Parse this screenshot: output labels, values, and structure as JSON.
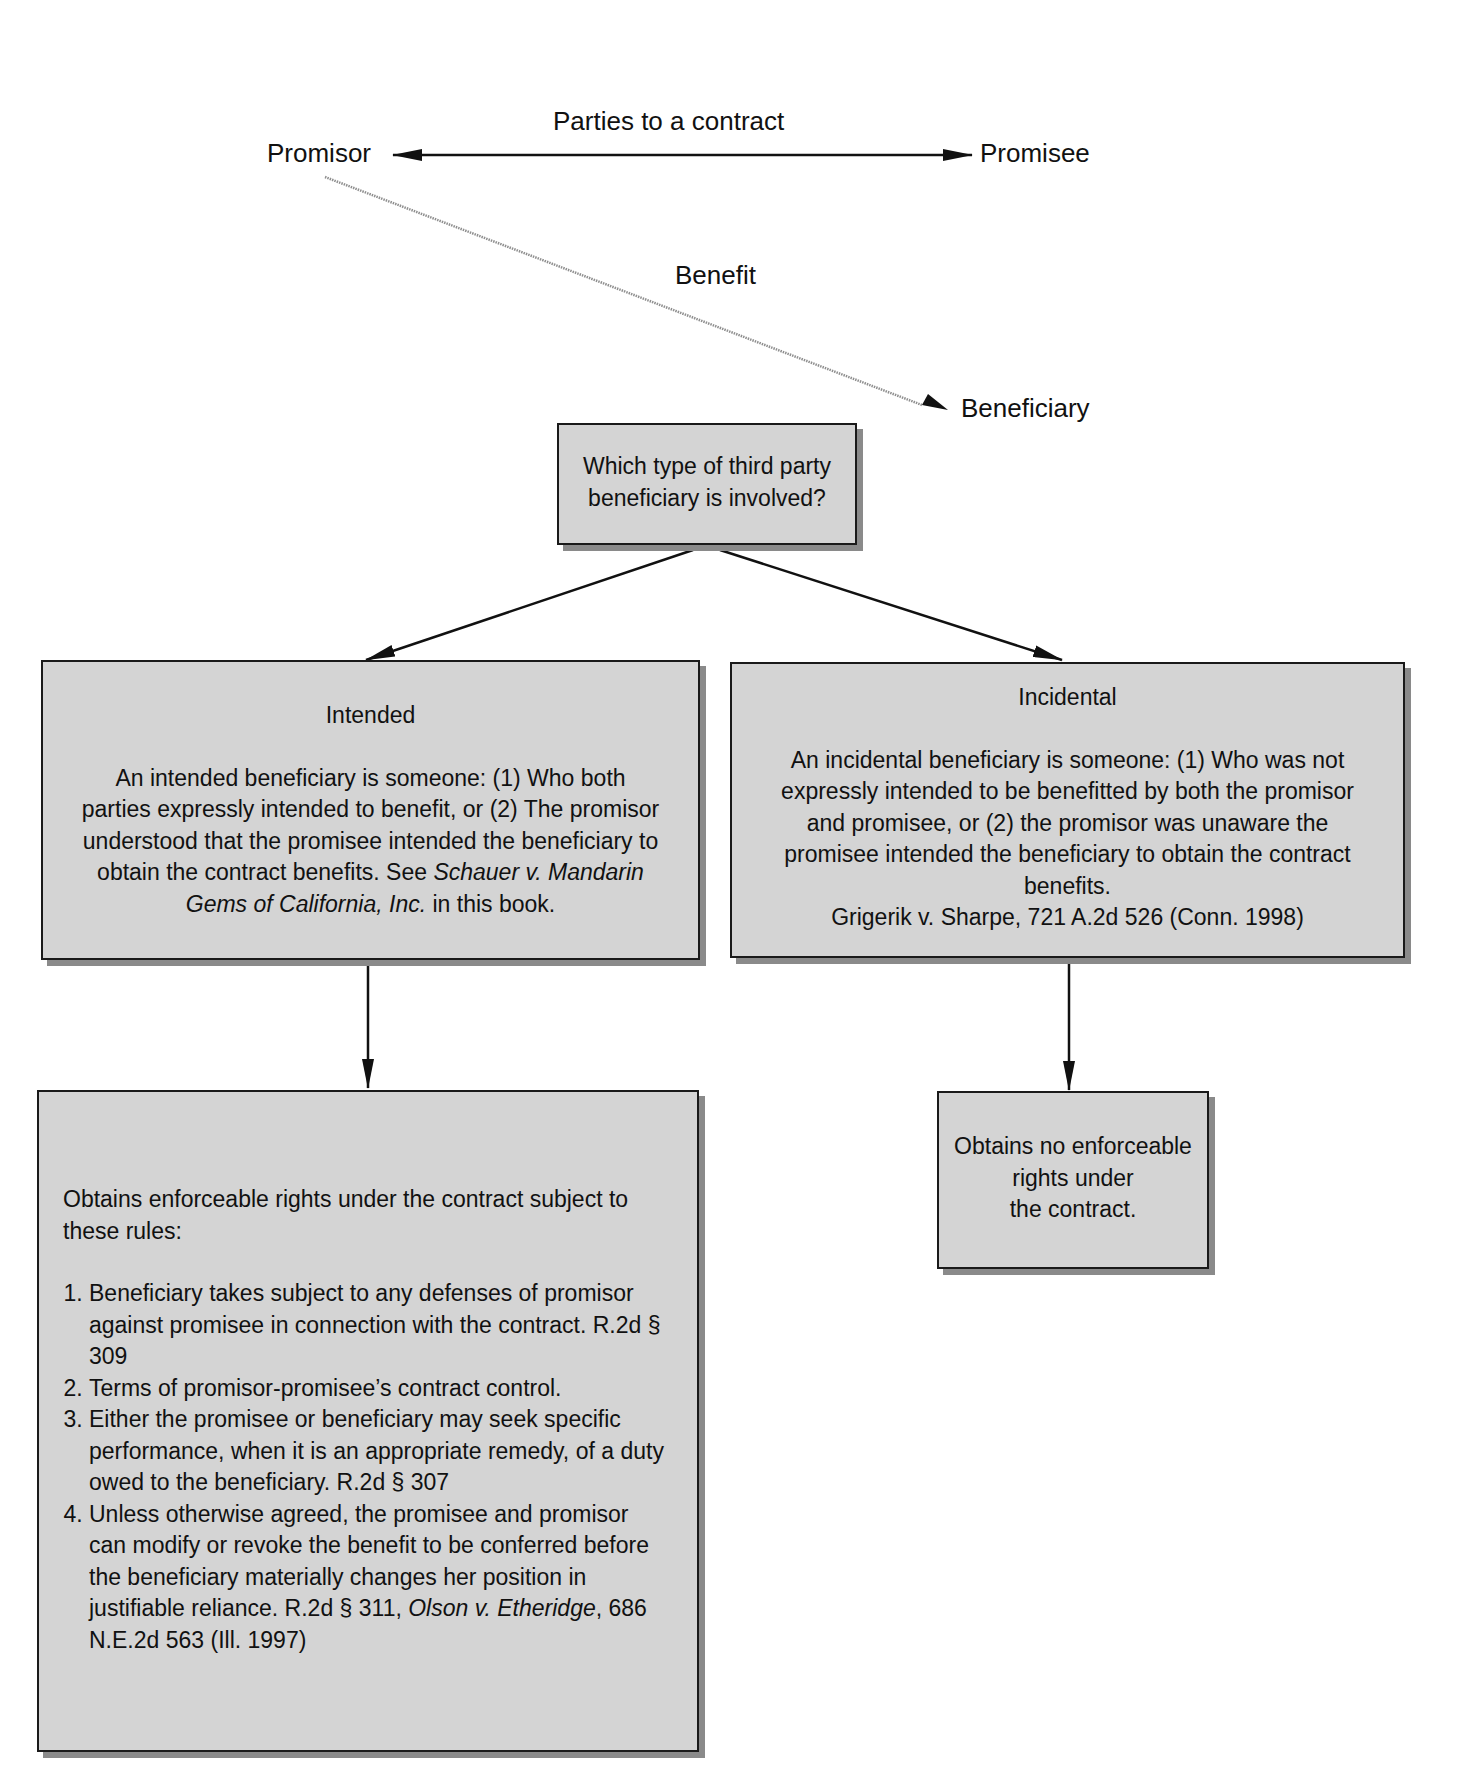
{
  "top": {
    "promisor": "Promisor",
    "promisee": "Promisee",
    "parties_label": "Parties to a contract",
    "benefit_label": "Benefit",
    "beneficiary": "Beneficiary"
  },
  "question_box": {
    "line1": "Which type of third party",
    "line2": "beneficiary is involved?"
  },
  "intended_box": {
    "title": "Intended",
    "body_plain": "An intended beneficiary is someone: (1) Who both parties expressly intended to benefit, or (2) The promisor understood that the promisee intended the beneficiary to obtain the contract benefits. See ",
    "case_italic": "Schauer v. Mandarin Gems of California, Inc.",
    "body_tail": " in this book."
  },
  "incidental_box": {
    "title": "Incidental",
    "body": "An incidental beneficiary is someone: (1) Who was not expressly intended to be benefitted by both the promisor and promisee, or (2) the promisor was unaware the promisee intended the beneficiary to obtain the contract benefits.",
    "citation": "Grigerik v. Sharpe, 721 A.2d 526 (Conn. 1998)"
  },
  "intended_result": {
    "intro": "Obtains enforceable rights under the contract subject to these rules:",
    "rules": [
      {
        "text": "Beneficiary takes subject to any defenses of promisor against promisee in connection with the contract. R.2d § 309"
      },
      {
        "text": "Terms of promisor-promisee’s contract control."
      },
      {
        "text": "Either the promisee or beneficiary may seek specific performance, when it is an appropriate remedy, of a duty owed to the beneficiary. R.2d § 307"
      },
      {
        "text_plain": "Unless otherwise agreed, the promisee and promisor can modify or revoke the benefit to be conferred before the beneficiary materially changes her position in justifiable reliance. R.2d § 311, ",
        "case_italic": "Olson v. Etheridge",
        "text_tail": ", 686 N.E.2d 563 (Ill. 1997)"
      }
    ]
  },
  "incidental_result": {
    "line1": "Obtains no enforceable",
    "line2": "rights under",
    "line3": "the contract."
  },
  "colors": {
    "box_fill": "#d4d4d4",
    "box_border": "#1a1a1a",
    "shadow": "#8a8a8a",
    "benefit_line": "#9a9a9a"
  }
}
